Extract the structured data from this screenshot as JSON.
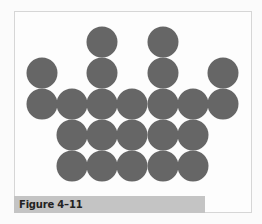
{
  "figure": {
    "caption": "Figure 4–11",
    "circle_color": "#666666",
    "caption_bar_color": "#c4c4c4",
    "circle_radius": 15.5,
    "column_centers_x": [
      42,
      72,
      102,
      132,
      163,
      193,
      223
    ],
    "row_centers_y": [
      42,
      73,
      104,
      135,
      166
    ],
    "rows": [
      {
        "row": 1,
        "columns": [
          3,
          5
        ]
      },
      {
        "row": 2,
        "columns": [
          1,
          3,
          5,
          7
        ]
      },
      {
        "row": 3,
        "columns": [
          1,
          2,
          3,
          4,
          5,
          6,
          7
        ]
      },
      {
        "row": 4,
        "columns": [
          2,
          3,
          4,
          5,
          6
        ]
      },
      {
        "row": 5,
        "columns": [
          2,
          3,
          4,
          5,
          6
        ]
      }
    ],
    "total_circles": 23
  }
}
